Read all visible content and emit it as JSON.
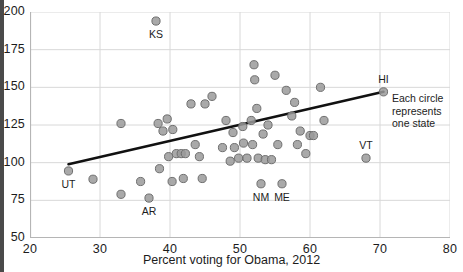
{
  "chart_data": {
    "type": "scatter",
    "title": "",
    "xlabel": "Percent voting for Obama, 2012",
    "ylabel": "",
    "xlim": [
      20,
      80
    ],
    "ylim": [
      50,
      200
    ],
    "xticks": [
      20,
      30,
      40,
      50,
      60,
      70,
      80
    ],
    "yticks": [
      50,
      75,
      100,
      125,
      150,
      175,
      200
    ],
    "grid": true,
    "legend_position": "none",
    "point_color": "#9a9a9a",
    "point_edge_color": "#6f6f6f",
    "trendline_color": "#111111",
    "grid_color": "#d8d8d8",
    "axis_color": "#b5b5b5",
    "series": [
      {
        "name": "states",
        "points": [
          {
            "x": 25.5,
            "y": 94.5,
            "label": "UT"
          },
          {
            "x": 29.0,
            "y": 89.0,
            "label": ""
          },
          {
            "x": 33.0,
            "y": 79.0,
            "label": ""
          },
          {
            "x": 35.8,
            "y": 87.5,
            "label": ""
          },
          {
            "x": 37.0,
            "y": 76.5,
            "label": "AR"
          },
          {
            "x": 38.0,
            "y": 194.0,
            "label": "KS"
          },
          {
            "x": 38.5,
            "y": 96.0,
            "label": ""
          },
          {
            "x": 38.3,
            "y": 126.0,
            "label": ""
          },
          {
            "x": 39.0,
            "y": 121.0,
            "label": ""
          },
          {
            "x": 39.6,
            "y": 129.0,
            "label": ""
          },
          {
            "x": 39.8,
            "y": 104.0,
            "label": ""
          },
          {
            "x": 40.4,
            "y": 122.0,
            "label": ""
          },
          {
            "x": 40.3,
            "y": 87.5,
            "label": ""
          },
          {
            "x": 40.9,
            "y": 106.0,
            "label": ""
          },
          {
            "x": 41.6,
            "y": 106.0,
            "label": ""
          },
          {
            "x": 41.9,
            "y": 89.5,
            "label": ""
          },
          {
            "x": 33.0,
            "y": 126.0,
            "label": ""
          },
          {
            "x": 42.2,
            "y": 106.0,
            "label": ""
          },
          {
            "x": 43.0,
            "y": 139.0,
            "label": ""
          },
          {
            "x": 43.6,
            "y": 112.0,
            "label": ""
          },
          {
            "x": 44.2,
            "y": 104.0,
            "label": ""
          },
          {
            "x": 44.6,
            "y": 89.5,
            "label": ""
          },
          {
            "x": 45.0,
            "y": 139.0,
            "label": ""
          },
          {
            "x": 46.0,
            "y": 144.0,
            "label": ""
          },
          {
            "x": 47.5,
            "y": 110.0,
            "label": ""
          },
          {
            "x": 48.0,
            "y": 128.0,
            "label": ""
          },
          {
            "x": 48.6,
            "y": 101.0,
            "label": ""
          },
          {
            "x": 49.0,
            "y": 120.0,
            "label": ""
          },
          {
            "x": 49.2,
            "y": 110.0,
            "label": ""
          },
          {
            "x": 49.8,
            "y": 103.0,
            "label": ""
          },
          {
            "x": 50.4,
            "y": 124.0,
            "label": ""
          },
          {
            "x": 50.5,
            "y": 113.0,
            "label": ""
          },
          {
            "x": 51.0,
            "y": 103.0,
            "label": ""
          },
          {
            "x": 51.6,
            "y": 128.0,
            "label": ""
          },
          {
            "x": 51.8,
            "y": 112.0,
            "label": ""
          },
          {
            "x": 52.0,
            "y": 165.0,
            "label": ""
          },
          {
            "x": 52.1,
            "y": 155.0,
            "label": ""
          },
          {
            "x": 52.4,
            "y": 136.0,
            "label": ""
          },
          {
            "x": 52.6,
            "y": 103.0,
            "label": ""
          },
          {
            "x": 53.0,
            "y": 86.0,
            "label": "NM"
          },
          {
            "x": 53.3,
            "y": 119.0,
            "label": ""
          },
          {
            "x": 53.6,
            "y": 102.0,
            "label": ""
          },
          {
            "x": 54.0,
            "y": 125.0,
            "label": ""
          },
          {
            "x": 54.5,
            "y": 102.0,
            "label": ""
          },
          {
            "x": 55.0,
            "y": 158.0,
            "label": ""
          },
          {
            "x": 55.4,
            "y": 112.0,
            "label": ""
          },
          {
            "x": 56.0,
            "y": 86.0,
            "label": "ME"
          },
          {
            "x": 56.6,
            "y": 148.0,
            "label": ""
          },
          {
            "x": 57.4,
            "y": 131.0,
            "label": ""
          },
          {
            "x": 57.8,
            "y": 140.0,
            "label": ""
          },
          {
            "x": 58.2,
            "y": 112.0,
            "label": ""
          },
          {
            "x": 58.6,
            "y": 121.0,
            "label": ""
          },
          {
            "x": 59.4,
            "y": 106.0,
            "label": ""
          },
          {
            "x": 60.0,
            "y": 118.0,
            "label": ""
          },
          {
            "x": 60.5,
            "y": 118.0,
            "label": ""
          },
          {
            "x": 61.5,
            "y": 150.0,
            "label": ""
          },
          {
            "x": 62.0,
            "y": 128.0,
            "label": ""
          },
          {
            "x": 68.0,
            "y": 103.0,
            "label": "VT"
          },
          {
            "x": 70.5,
            "y": 147.0,
            "label": "HI"
          }
        ]
      }
    ],
    "trendline": {
      "x1": 25.5,
      "y1": 99.0,
      "x2": 70.5,
      "y2": 147.0
    },
    "annotations": [
      {
        "id": "each-circle-note",
        "text": "Each circle\nrepresents\none state",
        "x": 71.0,
        "y": 140.0
      }
    ]
  },
  "axes": {
    "x_ticks": [
      "20",
      "30",
      "40",
      "50",
      "60",
      "70",
      "80"
    ],
    "y_ticks": [
      "50",
      "75",
      "100",
      "125",
      "150",
      "175",
      "200"
    ],
    "x_title": "Percent voting for Obama, 2012"
  },
  "annotation": {
    "line1": "Each circle",
    "line2": "represents",
    "line3": "one state"
  },
  "point_labels": {
    "ut": "UT",
    "ks": "KS",
    "ar": "AR",
    "nm": "NM",
    "me": "ME",
    "vt": "VT",
    "hi": "HI"
  }
}
